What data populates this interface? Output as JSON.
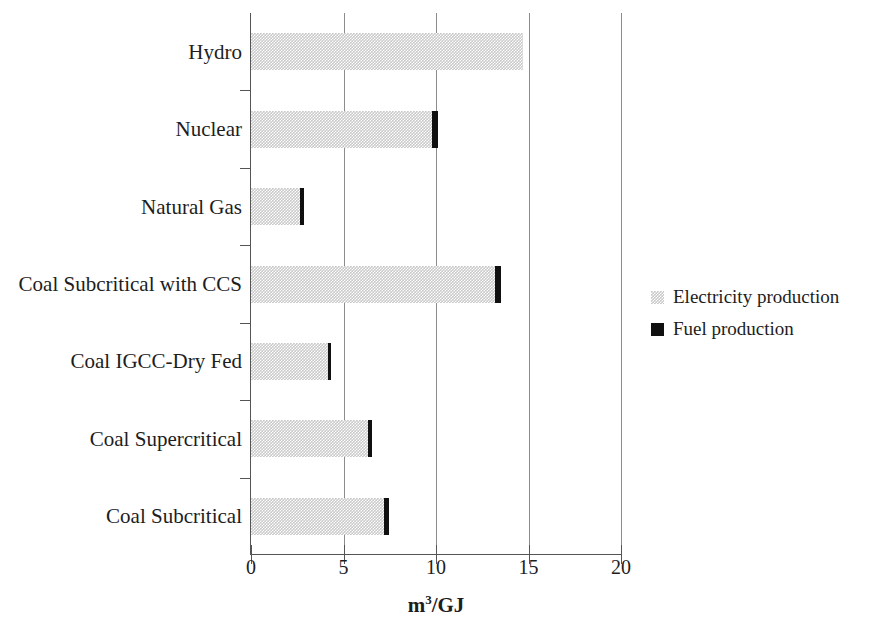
{
  "chart_data": {
    "type": "bar",
    "orientation": "horizontal",
    "stacked": true,
    "title": "",
    "subtitle": "",
    "xlabel": "m³/GJ",
    "ylabel": "",
    "xlim": [
      0,
      20
    ],
    "xticks": [
      0,
      5,
      10,
      15,
      20
    ],
    "xticklabels": [
      "0",
      "5",
      "10",
      "15",
      "20"
    ],
    "grid": "vertical",
    "legend_position": "right",
    "categories": [
      "Hydro",
      "Nuclear",
      "Natural Gas",
      "Coal Subcritical with CCS",
      "Coal IGCC-Dry Fed",
      "Coal Supercritical",
      "Coal Subcritical"
    ],
    "series": [
      {
        "name": "Electricity production",
        "color": "#c9c9c9",
        "values": [
          14.7,
          9.8,
          2.65,
          13.2,
          4.15,
          6.3,
          7.2
        ]
      },
      {
        "name": "Fuel production",
        "color": "#101010",
        "values": [
          0.0,
          0.3,
          0.2,
          0.3,
          0.2,
          0.25,
          0.25
        ]
      }
    ]
  },
  "axis": {
    "x_title_main": "m",
    "x_title_sup": "3",
    "x_title_rest": "/GJ"
  },
  "legend": {
    "items": [
      {
        "label": "Electricity production",
        "swatch": "light-gray-dither-swatch"
      },
      {
        "label": "Fuel production",
        "swatch": "black-swatch"
      }
    ]
  }
}
